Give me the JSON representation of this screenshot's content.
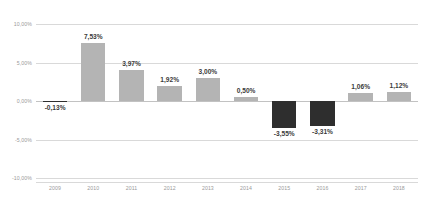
{
  "chart_data": {
    "type": "bar",
    "title": "",
    "subtitle": "",
    "xlabel": "",
    "ylabel": "",
    "categories": [
      "2009",
      "2010",
      "2011",
      "2012",
      "2013",
      "2014",
      "2015",
      "2016",
      "2017",
      "2018"
    ],
    "values": [
      -0.13,
      7.53,
      3.97,
      1.92,
      3.0,
      0.5,
      -3.55,
      -3.31,
      1.06,
      1.12
    ],
    "data_labels": [
      "-0,13%",
      "7,53%",
      "3,97%",
      "1,92%",
      "3,00%",
      "0,50%",
      "-3,55%",
      "-3,31%",
      "1,06%",
      "1,12%"
    ],
    "ylim": [
      -10,
      10
    ],
    "yticks": [
      10,
      5,
      0,
      -5,
      -10
    ],
    "ytick_labels": [
      "10,00%",
      "5,00%",
      "0,00%",
      "-5,00%",
      "-10,00%"
    ],
    "grid": true,
    "legend": null,
    "legend_position": "none",
    "colors": {
      "positive_bar": "#b4b4b4",
      "negative_bar": "#2e2e2e",
      "gridline": "#d9d9d9",
      "zero_line": "#c2c2c2",
      "tick_text": "#9a9a9a",
      "data_label_text": "#3b3b3b",
      "background": "#ffffff"
    }
  }
}
